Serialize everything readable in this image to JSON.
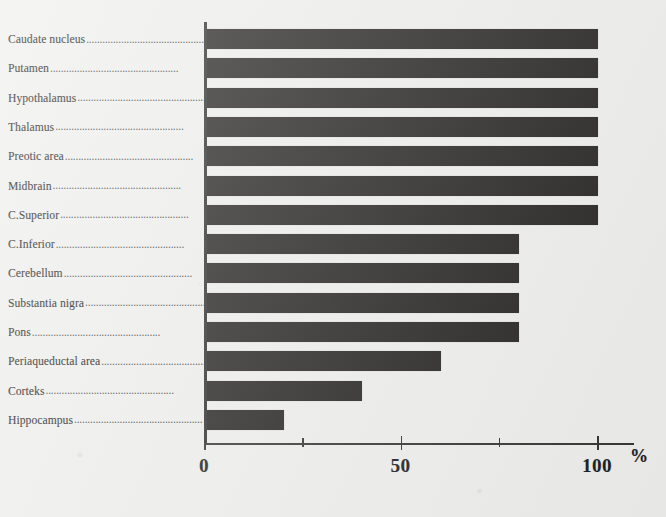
{
  "chart_data": {
    "type": "bar",
    "orientation": "horizontal",
    "title": "",
    "xlabel": "%",
    "ylabel": "",
    "xlim": [
      0,
      100
    ],
    "grid": false,
    "legend": null,
    "axis_unit_label": "%",
    "xticks": [
      0,
      25,
      50,
      75,
      100
    ],
    "xtick_labels": [
      "0",
      "",
      "50",
      "",
      "100"
    ],
    "categories": [
      "Caudate nucleus",
      "Putamen",
      "Hypothalamus",
      "Thalamus",
      "Preotic area",
      "Midbrain",
      "C.Superior",
      "C.Inferior",
      "Cerebellum",
      "Substantia nigra",
      "Pons",
      "Periaqueductal area",
      "Corteks",
      "Hippocampus"
    ],
    "values": [
      100,
      100,
      100,
      100,
      100,
      100,
      100,
      80,
      80,
      80,
      80,
      60,
      40,
      20
    ],
    "bar_color": "#23211f",
    "axis_color": "#2f2f2f",
    "background_color": "#eeeeec"
  },
  "leader_dots": "................................................"
}
